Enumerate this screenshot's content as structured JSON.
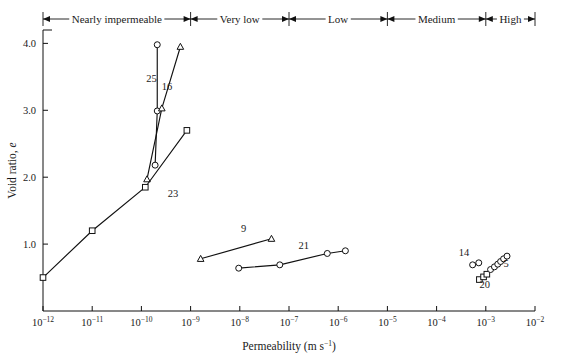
{
  "chart_data": {
    "type": "scatter",
    "title": "",
    "xlabel": "Permeability (m s−1)",
    "ylabel": "Void ratio, e",
    "xscale": "log",
    "xlim": [
      1e-12,
      0.01
    ],
    "ylim": [
      0,
      4.2
    ],
    "grid": false,
    "legend_position": "inline-labels",
    "xtick_labels": [
      "10−12",
      "10−11",
      "10−10",
      "10−9",
      "10−8",
      "10−7",
      "10−6",
      "10−5",
      "10−4",
      "10−3",
      "10−2"
    ],
    "xtick_mantissa": [
      "10",
      "10",
      "10",
      "10",
      "10",
      "10",
      "10",
      "10",
      "10",
      "10",
      "10"
    ],
    "xtick_exponents": [
      "-12",
      "-11",
      "-10",
      "-9",
      "-8",
      "-7",
      "-6",
      "-5",
      "-4",
      "-3",
      "-2"
    ],
    "ytick_labels": [
      "1.0",
      "2.0",
      "3.0",
      "4.0"
    ],
    "ytick_values": [
      1.0,
      2.0,
      3.0,
      4.0
    ],
    "categories_bar": {
      "label": "Permeability classification",
      "bands": [
        {
          "name": "Nearly impermeable",
          "from": 1e-12,
          "to": 1e-09
        },
        {
          "name": "Very low",
          "from": 1e-09,
          "to": 1e-07
        },
        {
          "name": "Low",
          "from": 1e-07,
          "to": 1e-05
        },
        {
          "name": "Medium",
          "from": 1e-05,
          "to": 0.001
        },
        {
          "name": "High",
          "from": 0.001,
          "to": 0.01
        }
      ]
    },
    "series": [
      {
        "name": "25",
        "label": "25",
        "marker": "circle",
        "label_x": 1.6e-10,
        "label_y": 3.42,
        "points": [
          {
            "x": 2.1e-10,
            "y": 3.98
          },
          {
            "x": 2.1e-10,
            "y": 2.99
          },
          {
            "x": 1.9e-10,
            "y": 2.18
          }
        ]
      },
      {
        "name": "16",
        "label": "16",
        "marker": "triangle",
        "label_x": 3.3e-10,
        "label_y": 3.3,
        "points": [
          {
            "x": 6.2e-10,
            "y": 3.95
          },
          {
            "x": 2.6e-10,
            "y": 3.03
          },
          {
            "x": 1.3e-10,
            "y": 1.97
          }
        ]
      },
      {
        "name": "23",
        "label": "23",
        "marker": "square",
        "label_x": 4.4e-10,
        "label_y": 1.7,
        "points": [
          {
            "x": 1e-12,
            "y": 0.5
          },
          {
            "x": 1e-11,
            "y": 1.2
          },
          {
            "x": 1.2e-10,
            "y": 1.85
          },
          {
            "x": 8.4e-10,
            "y": 2.7
          }
        ]
      },
      {
        "name": "9",
        "label": "9",
        "marker": "triangle",
        "label_x": 1.2e-08,
        "label_y": 1.18,
        "points": [
          {
            "x": 1.6e-09,
            "y": 0.78
          },
          {
            "x": 4.4e-08,
            "y": 1.08
          }
        ]
      },
      {
        "name": "21",
        "label": "21",
        "marker": "circle",
        "label_x": 2e-07,
        "label_y": 0.93,
        "points": [
          {
            "x": 9.5e-09,
            "y": 0.64
          },
          {
            "x": 6.5e-08,
            "y": 0.69
          },
          {
            "x": 6e-07,
            "y": 0.86
          },
          {
            "x": 1.4e-06,
            "y": 0.9
          }
        ]
      },
      {
        "name": "14",
        "label": "14",
        "marker": "circle",
        "label_x": 0.00036,
        "label_y": 0.82,
        "points": [
          {
            "x": 0.00054,
            "y": 0.69
          },
          {
            "x": 0.00072,
            "y": 0.72
          }
        ]
      },
      {
        "name": "20",
        "label": "20",
        "marker": "square",
        "label_x": 0.00095,
        "label_y": 0.35,
        "points": [
          {
            "x": 0.00074,
            "y": 0.47
          },
          {
            "x": 0.0009,
            "y": 0.51
          },
          {
            "x": 0.00105,
            "y": 0.55
          }
        ]
      },
      {
        "name": "5",
        "label": "5",
        "marker": "circle",
        "label_x": 0.0026,
        "label_y": 0.66,
        "points": [
          {
            "x": 0.00125,
            "y": 0.62
          },
          {
            "x": 0.0015,
            "y": 0.66
          },
          {
            "x": 0.00175,
            "y": 0.7
          },
          {
            "x": 0.002,
            "y": 0.74
          },
          {
            "x": 0.0023,
            "y": 0.78
          },
          {
            "x": 0.0027,
            "y": 0.82
          }
        ]
      }
    ]
  }
}
